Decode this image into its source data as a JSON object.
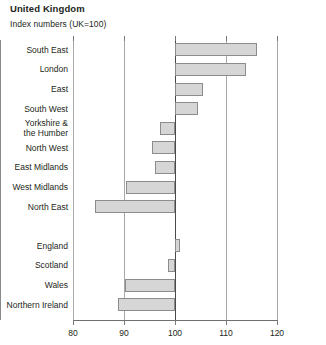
{
  "header": {
    "title": "United Kingdom",
    "subtitle": "Index numbers (UK=100)"
  },
  "chart_data": {
    "type": "bar",
    "orientation": "horizontal",
    "title": "United Kingdom",
    "subtitle": "Index numbers (UK=100)",
    "xlabel": "",
    "ylabel": "",
    "xlim": [
      80,
      120
    ],
    "xticks": [
      80,
      90,
      100,
      110,
      120
    ],
    "baseline": 100,
    "grid": true,
    "legend": "none",
    "bar_fill": "#d6d6d6",
    "bar_border": "#8c8c8c",
    "categories": [
      "South East",
      "London",
      "East",
      "South West",
      "Yorkshire & the Humber",
      "North West",
      "East Midlands",
      "West Midlands",
      "North East",
      "England",
      "Scotland",
      "Wales",
      "Northern Ireland"
    ],
    "values": [
      116.1,
      114.0,
      105.5,
      104.6,
      97.0,
      95.5,
      96.0,
      90.4,
      84.3,
      101.0,
      98.6,
      90.2,
      88.9
    ],
    "groups": [
      {
        "name": "regions",
        "items": [
          {
            "label": "South East",
            "label_lines": [
              "South East"
            ],
            "value": 116.1
          },
          {
            "label": "London",
            "label_lines": [
              "London"
            ],
            "value": 114.0
          },
          {
            "label": "East",
            "label_lines": [
              "East"
            ],
            "value": 105.5
          },
          {
            "label": "South West",
            "label_lines": [
              "South West"
            ],
            "value": 104.6
          },
          {
            "label": "Yorkshire & the Humber",
            "label_lines": [
              "Yorkshire &",
              "the Humber"
            ],
            "value": 97.0
          },
          {
            "label": "North West",
            "label_lines": [
              "North West"
            ],
            "value": 95.5
          },
          {
            "label": "East Midlands",
            "label_lines": [
              "East Midlands"
            ],
            "value": 96.0
          },
          {
            "label": "West Midlands",
            "label_lines": [
              "West Midlands"
            ],
            "value": 90.4
          },
          {
            "label": "North East",
            "label_lines": [
              "North East"
            ],
            "value": 84.3
          }
        ]
      },
      {
        "name": "countries",
        "items": [
          {
            "label": "England",
            "label_lines": [
              "England"
            ],
            "value": 101.0
          },
          {
            "label": "Scotland",
            "label_lines": [
              "Scotland"
            ],
            "value": 98.6
          },
          {
            "label": "Wales",
            "label_lines": [
              "Wales"
            ],
            "value": 90.2
          },
          {
            "label": "Northern Ireland",
            "label_lines": [
              "Northern Ireland"
            ],
            "value": 88.9
          }
        ]
      }
    ]
  }
}
